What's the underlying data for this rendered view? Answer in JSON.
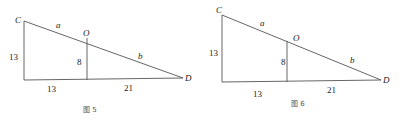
{
  "figures": [
    {
      "caption": "图 5",
      "points": {
        "C": "C",
        "O": "O",
        "D": "D"
      },
      "segments": {
        "CO": "a",
        "OD": "b"
      },
      "lengths": {
        "left_side": "13",
        "inner_vertical": "8",
        "bottom_left": "13",
        "bottom_right": "21"
      },
      "geometry": {
        "C": [
          24,
          21
        ],
        "BL": [
          24,
          80
        ],
        "O": [
          87,
          38
        ],
        "OB": [
          87,
          80
        ],
        "D": [
          183,
          78
        ]
      }
    },
    {
      "caption": "图 6",
      "points": {
        "C": "C",
        "O": "O",
        "D": "D"
      },
      "segments": {
        "CO": "a",
        "OD": "b"
      },
      "lengths": {
        "left_side": "13",
        "inner_vertical": "8",
        "bottom_left": "13",
        "bottom_right": "21"
      },
      "geometry": {
        "C": [
          222,
          15
        ],
        "BL": [
          222,
          82
        ],
        "O": [
          287,
          41
        ],
        "OB": [
          287,
          82
        ],
        "D": [
          381,
          80
        ]
      }
    }
  ],
  "colors": {
    "line": "#555555",
    "text": "#222222"
  }
}
